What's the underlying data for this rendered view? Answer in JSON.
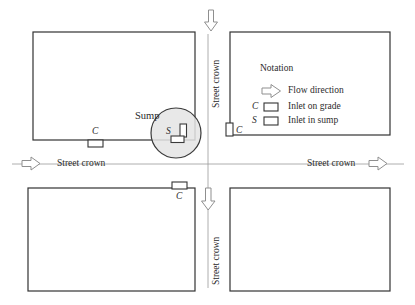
{
  "figure": {
    "type": "engineering-plan-diagram"
  },
  "labels": {
    "sump": "Sump",
    "inlet_sump_symbol": "S",
    "inlet_grade_symbol_left": "C",
    "inlet_grade_symbol_right": "C",
    "inlet_grade_symbol_bottom": "C",
    "street_crown_left": "Street crown",
    "street_crown_right": "Street crown",
    "street_crown_top": "Street crown",
    "street_crown_bottom": "Street crown"
  },
  "legend": {
    "title": "Notation",
    "entries": [
      {
        "symbol": "",
        "icon": "flow-arrow-icon",
        "label": "Flow direction"
      },
      {
        "symbol": "C",
        "icon": "inlet-box-icon",
        "label": "Inlet on grade"
      },
      {
        "symbol": "S",
        "icon": "inlet-box-icon",
        "label": "Inlet in sump"
      }
    ]
  },
  "elements": {
    "buildings": [
      {
        "name": "building-top-left",
        "x": 33,
        "y": 32,
        "w": 162,
        "h": 108
      },
      {
        "name": "building-top-right",
        "x": 230,
        "y": 32,
        "w": 160,
        "h": 103
      },
      {
        "name": "building-bottom-left",
        "x": 28,
        "y": 188,
        "w": 167,
        "h": 103
      },
      {
        "name": "building-bottom-right",
        "x": 230,
        "y": 188,
        "w": 160,
        "h": 103
      }
    ],
    "sump_circle": {
      "cx": 176,
      "cy": 133,
      "r": 25
    },
    "flow_arrows": [
      {
        "name": "flow-arrow-top",
        "direction": "down"
      },
      {
        "name": "flow-arrow-middle",
        "direction": "down"
      },
      {
        "name": "flow-arrow-left",
        "direction": "right"
      },
      {
        "name": "flow-arrow-right",
        "direction": "right"
      }
    ]
  },
  "colors": {
    "line": "#2b2b2b",
    "building_stroke": "#333333",
    "crown_line": "#8a8a8a",
    "arrow_stroke": "#8f8f8f",
    "sump_fill": "#e2e2e2",
    "sump_stroke": "#3a3a3a",
    "text": "#2b2b2b",
    "background": "#ffffff"
  }
}
